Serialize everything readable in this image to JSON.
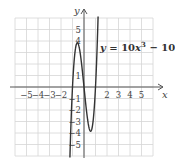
{
  "chart_data": {
    "type": "line",
    "title": "",
    "function": "y = 10x^3 - 10x",
    "equation_label": {
      "prefix": "y",
      "eq": " = 10",
      "var1": "x",
      "exp": "3",
      "minus": " − 10",
      "var2": "x"
    },
    "xlabel": "x",
    "ylabel": "y",
    "xlim": [
      -6,
      6
    ],
    "ylim": [
      -6,
      6
    ],
    "grid": true,
    "x_tick_labels": [
      "−5",
      "−4",
      "−3",
      "−2",
      "2",
      "3",
      "4",
      "5"
    ],
    "x_tick_values": [
      -5,
      -4,
      -3,
      -2,
      2,
      3,
      4,
      5
    ],
    "y_tick_labels": [
      "5",
      "4",
      "1",
      "−1",
      "−2",
      "−3",
      "−4",
      "−5"
    ],
    "y_tick_values": [
      5,
      4,
      1,
      -1,
      -2,
      -3,
      -4,
      -5
    ],
    "series": [
      {
        "name": "y = 10x^3 - 10x",
        "x": [
          -1.1,
          -1.0,
          -0.8,
          -0.577,
          -0.4,
          -0.2,
          0,
          0.2,
          0.4,
          0.577,
          0.8,
          1.0,
          1.1
        ],
        "y": [
          -3.41,
          0,
          2.88,
          3.85,
          3.36,
          1.92,
          0,
          -1.92,
          -3.36,
          -3.85,
          -2.88,
          0,
          3.41
        ]
      }
    ],
    "key_points": {
      "local_max": [
        -0.577,
        3.85
      ],
      "local_min": [
        0.577,
        -3.85
      ],
      "zeros": [
        -1,
        0,
        1
      ]
    }
  },
  "colors": {
    "grid": "#d6d6d6",
    "axis": "#555555",
    "curve": "#333333"
  }
}
